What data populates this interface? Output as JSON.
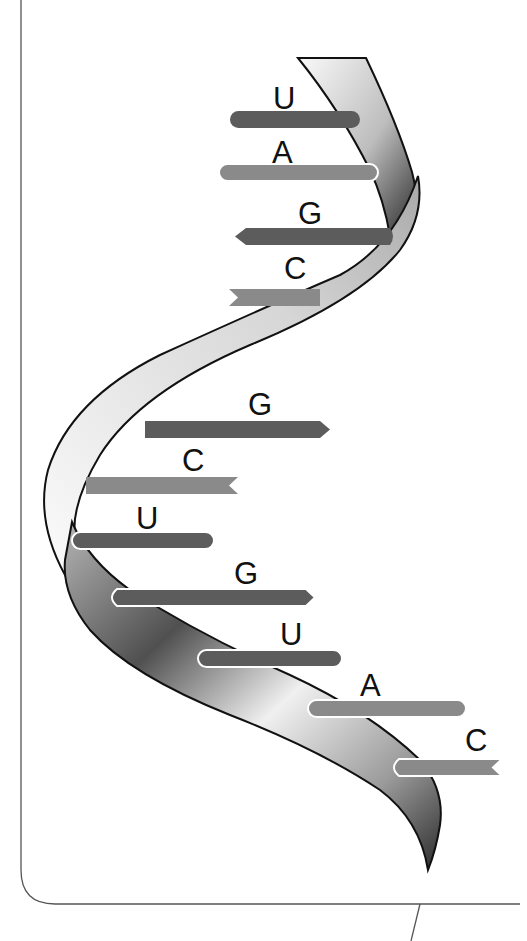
{
  "diagram": {
    "type": "single-stranded nucleic acid ribbon with nitrogenous bases",
    "colors": {
      "background": "#ffffff",
      "frame": "#555555",
      "ribbon_light": "#f4f4f4",
      "ribbon_dark": "#2e2e2e",
      "base_dark": "#5c5c5c",
      "base_light": "#8a8a8a",
      "outline": "#111111"
    },
    "bases": [
      {
        "letter": "U",
        "shade": "dark",
        "end": "round"
      },
      {
        "letter": "A",
        "shade": "light",
        "end": "round"
      },
      {
        "letter": "G",
        "shade": "dark",
        "end": "point"
      },
      {
        "letter": "C",
        "shade": "light",
        "end": "notch"
      },
      {
        "letter": "G",
        "shade": "dark",
        "end": "point"
      },
      {
        "letter": "C",
        "shade": "light",
        "end": "notch"
      },
      {
        "letter": "U",
        "shade": "dark",
        "end": "round"
      },
      {
        "letter": "G",
        "shade": "dark",
        "end": "point"
      },
      {
        "letter": "U",
        "shade": "dark",
        "end": "round"
      },
      {
        "letter": "A",
        "shade": "light",
        "end": "round"
      },
      {
        "letter": "C",
        "shade": "light",
        "end": "notch"
      }
    ]
  }
}
